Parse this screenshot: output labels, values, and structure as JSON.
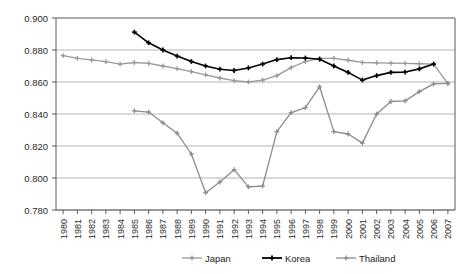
{
  "chart_data": {
    "type": "line",
    "title": "",
    "subtitle": "",
    "xlabel": "",
    "ylabel": "",
    "xlim": [
      1980,
      2007
    ],
    "ylim": [
      0.78,
      0.9
    ],
    "grid": true,
    "legend_position": "bottom",
    "x": [
      1980,
      1981,
      1982,
      1983,
      1984,
      1985,
      1986,
      1987,
      1988,
      1989,
      1990,
      1991,
      1992,
      1993,
      1994,
      1995,
      1996,
      1997,
      1998,
      1999,
      2000,
      2001,
      2002,
      2003,
      2004,
      2005,
      2006,
      2007
    ],
    "ytick_labels": [
      "0.900",
      "0.880",
      "0.860",
      "0.840",
      "0.820",
      "0.800",
      "0.780"
    ],
    "ytick_values": [
      0.9,
      0.88,
      0.86,
      0.84,
      0.82,
      0.8,
      0.78
    ],
    "xtick_labels": [
      "1980",
      "1981",
      "1982",
      "1983",
      "1984",
      "1985",
      "1986",
      "1987",
      "1988",
      "1989",
      "1990",
      "1991",
      "1992",
      "1993",
      "1994",
      "1995",
      "1996",
      "1997",
      "1998",
      "1999",
      "2000",
      "2001",
      "2002",
      "2003",
      "2004",
      "2005",
      "2006",
      "2007"
    ],
    "series": [
      {
        "name": "Japan",
        "color": "#999999",
        "marker": "plus",
        "x": [
          1980,
          1981,
          1982,
          1983,
          1984,
          1985,
          1986,
          1987,
          1988,
          1989,
          1990,
          1991,
          1992,
          1993,
          1994,
          1995,
          1996,
          1997,
          1998,
          1999,
          2000,
          2001,
          2002,
          2003,
          2004,
          2005,
          2006,
          2007
        ],
        "values": [
          0.8765,
          0.8748,
          0.8738,
          0.8727,
          0.8712,
          0.8722,
          0.8717,
          0.87,
          0.8683,
          0.8665,
          0.8645,
          0.8625,
          0.8608,
          0.86,
          0.8612,
          0.864,
          0.869,
          0.8728,
          0.8748,
          0.8748,
          0.8736,
          0.8722,
          0.872,
          0.8718,
          0.8716,
          0.8714,
          0.8712,
          0.859
        ]
      },
      {
        "name": "Korea",
        "color": "#000000",
        "marker": "plus",
        "x": [
          1985,
          1986,
          1987,
          1988,
          1989,
          1990,
          1991,
          1992,
          1993,
          1994,
          1995,
          1996,
          1997,
          1998,
          1999,
          2000,
          2001,
          2002,
          2003,
          2004,
          2005,
          2006
        ],
        "values": [
          0.8912,
          0.8845,
          0.88,
          0.8762,
          0.8728,
          0.87,
          0.868,
          0.8672,
          0.8688,
          0.8712,
          0.874,
          0.8752,
          0.875,
          0.8742,
          0.87,
          0.866,
          0.8612,
          0.864,
          0.866,
          0.8662,
          0.8682,
          0.8712
        ]
      },
      {
        "name": "Thailand",
        "color": "#8c8c8c",
        "marker": "plus",
        "x": [
          1985,
          1986,
          1987,
          1988,
          1989,
          1990,
          1991,
          1992,
          1993,
          1994,
          1995,
          1996,
          1997,
          1998,
          1999,
          2000,
          2001,
          2002,
          2003,
          2004,
          2005,
          2006,
          2007
        ],
        "values": [
          0.842,
          0.8412,
          0.8345,
          0.828,
          0.815,
          0.7908,
          0.7975,
          0.8052,
          0.7945,
          0.795,
          0.829,
          0.8408,
          0.844,
          0.857,
          0.829,
          0.8275,
          0.8218,
          0.84,
          0.8478,
          0.8482,
          0.854,
          0.8588,
          0.8592
        ]
      }
    ]
  },
  "legend": {
    "items": [
      {
        "label": "Japan"
      },
      {
        "label": "Korea"
      },
      {
        "label": "Thailand"
      }
    ]
  }
}
